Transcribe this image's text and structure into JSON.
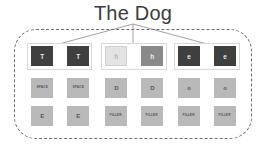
{
  "title": "The Dog",
  "container": {
    "style": "dashed-rounded"
  },
  "connectors": {
    "count": 3,
    "color": "#8a8a8a"
  },
  "groups": [
    {
      "name": "group-1",
      "rows": [
        {
          "name": "row-selected",
          "boxed": true,
          "tiles": [
            {
              "label": "T",
              "variant": "dark"
            },
            {
              "label": "T",
              "variant": "dark"
            }
          ]
        },
        {
          "name": "row-alt-1",
          "boxed": false,
          "tiles": [
            {
              "label": "SPACE",
              "variant": "tiny"
            },
            {
              "label": "SPACE",
              "variant": "tiny"
            }
          ]
        },
        {
          "name": "row-alt-2",
          "boxed": false,
          "tiles": [
            {
              "label": "E",
              "variant": "letter"
            },
            {
              "label": "E",
              "variant": "letter"
            }
          ]
        }
      ]
    },
    {
      "name": "group-2",
      "rows": [
        {
          "name": "row-selected",
          "boxed": true,
          "tiles": [
            {
              "label": "h",
              "variant": "light"
            },
            {
              "label": "h",
              "variant": "mid"
            }
          ]
        },
        {
          "name": "row-alt-1",
          "boxed": false,
          "tiles": [
            {
              "label": "D",
              "variant": "letter"
            },
            {
              "label": "D",
              "variant": "letter"
            }
          ]
        },
        {
          "name": "row-alt-2",
          "boxed": false,
          "tiles": [
            {
              "label": "FILLER",
              "variant": "tiny"
            },
            {
              "label": "FILLER",
              "variant": "tiny"
            }
          ]
        }
      ]
    },
    {
      "name": "group-3",
      "rows": [
        {
          "name": "row-selected",
          "boxed": true,
          "tiles": [
            {
              "label": "e",
              "variant": "dark"
            },
            {
              "label": "e",
              "variant": "dark"
            }
          ]
        },
        {
          "name": "row-alt-1",
          "boxed": false,
          "tiles": [
            {
              "label": "o",
              "variant": "letter"
            },
            {
              "label": "o",
              "variant": "letter"
            }
          ]
        },
        {
          "name": "row-alt-2",
          "boxed": false,
          "tiles": [
            {
              "label": "FILLER",
              "variant": "tiny"
            },
            {
              "label": "FILLER",
              "variant": "tiny"
            }
          ]
        }
      ]
    }
  ],
  "colors": {
    "tile_dark": "#3f3f3f",
    "tile_light": "#e3e3e3",
    "tile_mid": "#8a8a8a",
    "tile_grey": "#b9b9b9",
    "border_dashed": "#6e6e6e",
    "group_box": "#d8d8d8",
    "title_text": "#3b3b3b"
  }
}
